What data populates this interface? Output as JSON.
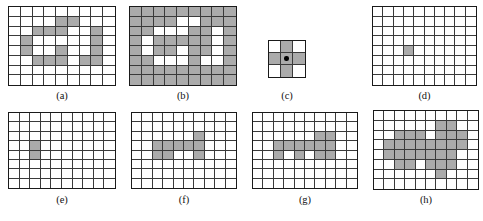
{
  "figure": {
    "kind": "morphological-grid-panels",
    "panel_count": 8,
    "colors": {
      "foreground_cell": "#ababab",
      "background_cell": "#ffffff",
      "grid_line": "#3a3a3a",
      "outer_border": "#1a1a1a",
      "origin_dot": "#000000",
      "label_text": "#111111",
      "page_background": "#ffffff"
    }
  },
  "panels": [
    {
      "id": "a",
      "label": "(a)",
      "cols": 9,
      "rows": 8,
      "inverted": false,
      "origin": null,
      "on_cells": [
        [
          1,
          4
        ],
        [
          1,
          5
        ],
        [
          2,
          2
        ],
        [
          2,
          3
        ],
        [
          2,
          4
        ],
        [
          2,
          7
        ],
        [
          3,
          1
        ],
        [
          3,
          7
        ],
        [
          4,
          1
        ],
        [
          4,
          4
        ],
        [
          4,
          7
        ],
        [
          5,
          2
        ],
        [
          5,
          3
        ],
        [
          5,
          4
        ],
        [
          5,
          6
        ],
        [
          5,
          7
        ]
      ]
    },
    {
      "id": "b",
      "label": "(b)",
      "cols": 9,
      "rows": 8,
      "inverted": true,
      "origin": null,
      "on_cells": [
        [
          1,
          4
        ],
        [
          1,
          5
        ],
        [
          2,
          2
        ],
        [
          2,
          3
        ],
        [
          2,
          4
        ],
        [
          2,
          7
        ],
        [
          3,
          1
        ],
        [
          3,
          7
        ],
        [
          4,
          1
        ],
        [
          4,
          4
        ],
        [
          4,
          7
        ],
        [
          5,
          2
        ],
        [
          5,
          3
        ],
        [
          5,
          4
        ],
        [
          5,
          6
        ],
        [
          5,
          7
        ]
      ]
    },
    {
      "id": "c",
      "label": "(c)",
      "cols": 3,
      "rows": 3,
      "inverted": false,
      "origin": [
        1,
        1
      ],
      "on_cells": [
        [
          0,
          1
        ],
        [
          1,
          0
        ],
        [
          1,
          1
        ],
        [
          1,
          2
        ],
        [
          2,
          1
        ]
      ]
    },
    {
      "id": "d",
      "label": "(d)",
      "cols": 10,
      "rows": 8,
      "inverted": false,
      "origin": null,
      "on_cells": [
        [
          4,
          3
        ]
      ]
    },
    {
      "id": "e",
      "label": "(e)",
      "cols": 10,
      "rows": 8,
      "inverted": false,
      "origin": null,
      "on_cells": [
        [
          3,
          2
        ],
        [
          4,
          2
        ]
      ]
    },
    {
      "id": "f",
      "label": "(f)",
      "cols": 10,
      "rows": 8,
      "inverted": false,
      "origin": null,
      "on_cells": [
        [
          2,
          6
        ],
        [
          3,
          2
        ],
        [
          3,
          3
        ],
        [
          3,
          4
        ],
        [
          3,
          5
        ],
        [
          3,
          6
        ],
        [
          4,
          2
        ],
        [
          4,
          3
        ],
        [
          4,
          6
        ]
      ]
    },
    {
      "id": "g",
      "label": "(g)",
      "cols": 10,
      "rows": 8,
      "inverted": false,
      "origin": null,
      "on_cells": [
        [
          2,
          6
        ],
        [
          2,
          7
        ],
        [
          3,
          2
        ],
        [
          3,
          3
        ],
        [
          3,
          4
        ],
        [
          3,
          5
        ],
        [
          3,
          6
        ],
        [
          3,
          7
        ],
        [
          4,
          2
        ],
        [
          4,
          4
        ],
        [
          4,
          6
        ],
        [
          4,
          7
        ]
      ]
    },
    {
      "id": "h",
      "label": "(h)",
      "cols": 10,
      "rows": 8,
      "inverted": false,
      "origin": null,
      "on_cells": [
        [
          1,
          6
        ],
        [
          1,
          7
        ],
        [
          2,
          2
        ],
        [
          2,
          3
        ],
        [
          2,
          4
        ],
        [
          2,
          6
        ],
        [
          2,
          7
        ],
        [
          2,
          8
        ],
        [
          3,
          1
        ],
        [
          3,
          2
        ],
        [
          3,
          3
        ],
        [
          3,
          4
        ],
        [
          3,
          5
        ],
        [
          3,
          6
        ],
        [
          3,
          7
        ],
        [
          3,
          8
        ],
        [
          4,
          1
        ],
        [
          4,
          2
        ],
        [
          4,
          3
        ],
        [
          4,
          4
        ],
        [
          4,
          5
        ],
        [
          4,
          6
        ],
        [
          4,
          7
        ],
        [
          5,
          2
        ],
        [
          5,
          3
        ],
        [
          5,
          5
        ],
        [
          5,
          6
        ],
        [
          5,
          7
        ],
        [
          6,
          6
        ]
      ]
    }
  ]
}
